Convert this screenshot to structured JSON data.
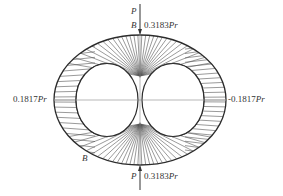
{
  "diagram": {
    "labels": {
      "top_load": "P",
      "bottom_load": "P",
      "top_point": "B",
      "bottom_point": "B",
      "left_region": "A",
      "right_region": "C",
      "top_value": "0.3183",
      "top_value_unit": "Pr",
      "bottom_value": "0.3183",
      "bottom_value_unit": "Pr",
      "left_value": "0.1817",
      "left_value_unit": "Pr",
      "right_value": "-0.1817",
      "right_value_unit": "Pr"
    },
    "colors": {
      "stroke": "#2b2b2b",
      "hatch": "#555555",
      "axis": "#888888",
      "background": "#ffffff"
    }
  }
}
